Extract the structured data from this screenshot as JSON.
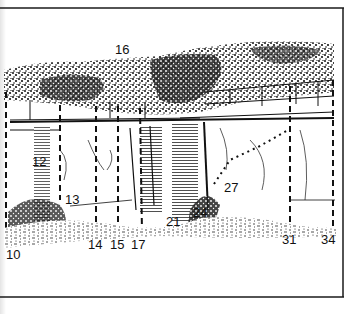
{
  "figure": {
    "border_color": "#1a1a1a",
    "ink_color": "#111111",
    "paper_color": "#ffffff"
  },
  "route_labels": [
    {
      "id": "10",
      "text": "10",
      "x": 6,
      "y": 248
    },
    {
      "id": "12",
      "text": "12",
      "x": 32,
      "y": 155
    },
    {
      "id": "13",
      "text": "13",
      "x": 65,
      "y": 193
    },
    {
      "id": "14",
      "text": "14",
      "x": 88,
      "y": 238
    },
    {
      "id": "15",
      "text": "15",
      "x": 110,
      "y": 238
    },
    {
      "id": "16",
      "text": "16",
      "x": 115,
      "y": 43
    },
    {
      "id": "17",
      "text": "17",
      "x": 131,
      "y": 238
    },
    {
      "id": "21",
      "text": "21",
      "x": 166,
      "y": 215
    },
    {
      "id": "24",
      "text": "24",
      "x": 193,
      "y": 206
    },
    {
      "id": "27",
      "text": "27",
      "x": 224,
      "y": 181
    },
    {
      "id": "31",
      "text": "31",
      "x": 282,
      "y": 233
    },
    {
      "id": "34",
      "text": "34",
      "x": 321,
      "y": 233
    }
  ]
}
